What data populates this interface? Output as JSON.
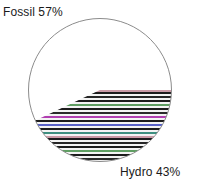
{
  "chart_data": {
    "type": "pie",
    "title": "",
    "categories": [
      "Fossil",
      "Hydro"
    ],
    "values": [
      57,
      43
    ],
    "labels": [
      "Fossil 57%",
      "Hydro 43%"
    ],
    "units": "%",
    "legend": "none",
    "annotations": [
      {
        "text": "Fossil 57%",
        "position": "top-left"
      },
      {
        "text": "Hydro 43%",
        "position": "bottom-right"
      }
    ],
    "slices": [
      {
        "name": "Fossil",
        "value": 57,
        "label": "Fossil 57%",
        "fill": "#ffffff",
        "pattern": "none",
        "start_angle_deg": 205.2,
        "end_angle_deg": 0.0
      },
      {
        "name": "Hydro",
        "value": 43,
        "label": "Hydro 43%",
        "fill": "#ffffff",
        "pattern": "horizontal-stripes",
        "start_angle_deg": 0.0,
        "end_angle_deg": 205.2
      }
    ],
    "geometry": {
      "center_x": 100,
      "center_y": 90,
      "radius": 72
    }
  },
  "chart": {
    "outline_color": "#8c8c8c",
    "stripe_dark": "#1c1c1c",
    "stripe_light": "#f2f2f2",
    "accent_green": "#5f9e62",
    "accent_blue": "#5a63c8",
    "accent_magenta": "#b13fb1",
    "accent_teal": "#3f8f80",
    "accent_pink": "#c99aa6",
    "label_color": "#1a1a1a"
  },
  "labels": {
    "fossil": "Fossil 57%",
    "hydro": "Hydro 43%"
  }
}
